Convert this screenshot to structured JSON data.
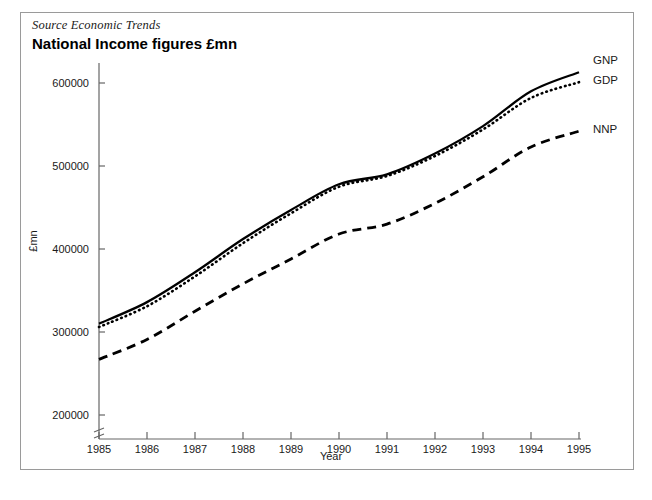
{
  "figure": {
    "source_note": "Source Economic Trends",
    "title": "National Income figures £mn"
  },
  "chart_data": {
    "type": "line",
    "title": "National Income figures £mn",
    "subtitle": "Source Economic Trends",
    "xlabel": "Year",
    "ylabel": "£mn",
    "x": [
      1985,
      1986,
      1987,
      1988,
      1989,
      1990,
      1991,
      1992,
      1993,
      1994,
      1995
    ],
    "xtick_labels": [
      "1985",
      "1986",
      "1987",
      "1988",
      "1989",
      "1990",
      "1991",
      "1992",
      "1993",
      "1994",
      "1995"
    ],
    "ytick_labels": [
      "200000",
      "300000",
      "400000",
      "500000",
      "600000"
    ],
    "yticks": [
      200000,
      300000,
      400000,
      500000,
      600000
    ],
    "xlim": [
      1985,
      1995
    ],
    "ylim": [
      200000,
      625000
    ],
    "grid": false,
    "axis_break": true,
    "legend_position": "right-of-line-ends",
    "series": [
      {
        "name": "GNP",
        "style": "solid",
        "color": "#000000",
        "values": [
          310000,
          336000,
          372000,
          412000,
          447000,
          478000,
          490000,
          515000,
          548000,
          590000,
          613000
        ]
      },
      {
        "name": "GDP",
        "style": "dotted",
        "color": "#000000",
        "values": [
          306000,
          331000,
          367000,
          407000,
          443000,
          475000,
          488000,
          512000,
          544000,
          582000,
          601000
        ]
      },
      {
        "name": "NNP",
        "style": "dashed",
        "color": "#000000",
        "values": [
          267000,
          291000,
          325000,
          358000,
          388000,
          418000,
          430000,
          455000,
          487000,
          523000,
          542000
        ]
      }
    ]
  },
  "colors": {
    "ink": "#000000",
    "axis": "#555555",
    "border": "#9a9a9a",
    "background": "#ffffff"
  }
}
